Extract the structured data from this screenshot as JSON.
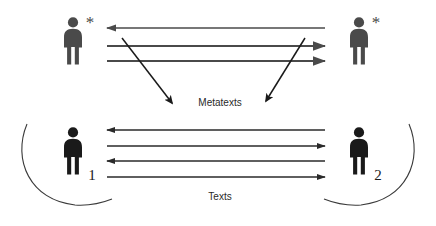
{
  "diagram": {
    "type": "communication-model-diagram",
    "background_color": "#ffffff",
    "title_visible": false,
    "labels": {
      "metatexts": "Metatexts",
      "texts": "Texts"
    },
    "actors": [
      {
        "id": "top-left-actor",
        "name": "person-asterisk-left",
        "label": "*",
        "color": "#4a4a4a",
        "level": "meta",
        "position": "top-left"
      },
      {
        "id": "top-right-actor",
        "name": "person-asterisk-right",
        "label": "*",
        "color": "#4a4a4a",
        "level": "meta",
        "position": "top-right"
      },
      {
        "id": "bottom-left-actor",
        "name": "person-one",
        "label": "1",
        "color": "#1a1a1a",
        "level": "base",
        "position": "bottom-left"
      },
      {
        "id": "bottom-right-actor",
        "name": "person-two",
        "label": "2",
        "color": "#1a1a1a",
        "level": "base",
        "position": "bottom-right"
      }
    ],
    "metatext_arrows": [
      {
        "index": 1,
        "direction": "left",
        "y": 28,
        "color": "#4a4a4a"
      },
      {
        "index": 2,
        "direction": "right",
        "y": 46,
        "color": "#4a4a4a"
      },
      {
        "index": 3,
        "direction": "right",
        "y": 61,
        "color": "#4a4a4a"
      }
    ],
    "text_arrows": [
      {
        "index": 1,
        "direction": "left",
        "y": 130,
        "color": "#2a2a2a"
      },
      {
        "index": 2,
        "direction": "right",
        "y": 146,
        "color": "#2a2a2a"
      },
      {
        "index": 3,
        "direction": "left",
        "y": 161,
        "color": "#2a2a2a"
      },
      {
        "index": 4,
        "direction": "right",
        "y": 177,
        "color": "#2a2a2a"
      }
    ],
    "diagonal_arrows": [
      {
        "id": "left-diagonal",
        "from": "top-left-region",
        "to": "metatexts-label",
        "direction": "down-right",
        "color": "#1a1a1a"
      },
      {
        "id": "right-diagonal",
        "from": "top-right-region",
        "to": "metatexts-label",
        "direction": "down-left",
        "color": "#1a1a1a"
      }
    ],
    "arcs": [
      {
        "id": "left-arc",
        "name": "left-enclosing-arc",
        "side": "left",
        "color": "#3a3a3a"
      },
      {
        "id": "right-arc",
        "name": "right-enclosing-arc",
        "side": "right",
        "color": "#3a3a3a"
      }
    ]
  }
}
